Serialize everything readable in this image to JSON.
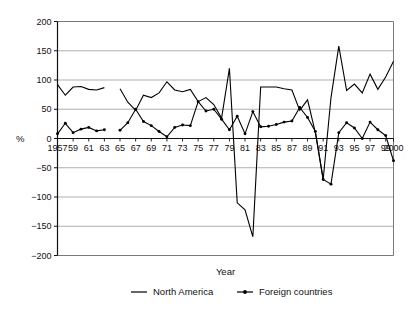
{
  "chart_data": {
    "type": "line",
    "title": "",
    "xlabel": "Year",
    "ylabel": "%",
    "ylim": [
      -200,
      200
    ],
    "xlim": [
      1957,
      2000
    ],
    "yticks": [
      200,
      150,
      100,
      50,
      0,
      -50,
      -100,
      -150,
      -200
    ],
    "ytick_labels": [
      "200",
      "150",
      "100",
      "50",
      "0",
      "−50",
      "−100",
      "−150",
      "−200"
    ],
    "xticks": [
      1957,
      1959,
      1961,
      1963,
      1965,
      1967,
      1969,
      1971,
      1973,
      1975,
      1977,
      1979,
      1981,
      1983,
      1985,
      1987,
      1989,
      1991,
      1993,
      1995,
      1997,
      1999,
      2000
    ],
    "xtick_labels": [
      "1957",
      "59",
      "61",
      "63",
      "65",
      "67",
      "69",
      "71",
      "73",
      "75",
      "77",
      "79",
      "81",
      "83",
      "85",
      "87",
      "89",
      "91",
      "93",
      "95",
      "97",
      "99",
      "2000"
    ],
    "grid": true,
    "grid_axis": "y",
    "legend_position": "bottom",
    "series": [
      {
        "name": "North America",
        "marker": "none",
        "color": "#000000",
        "x": [
          1957,
          1958,
          1959,
          1960,
          1961,
          1962,
          1963,
          1965,
          1966,
          1967,
          1968,
          1969,
          1970,
          1971,
          1972,
          1973,
          1974,
          1975,
          1976,
          1977,
          1978,
          1979,
          1980,
          1981,
          1982,
          1983,
          1984,
          1985,
          1986,
          1987,
          1988,
          1989,
          1990,
          1991,
          1992,
          1993,
          1994,
          1995,
          1996,
          1997,
          1998,
          1999,
          2000
        ],
        "y": [
          92,
          74,
          88,
          89,
          84,
          83,
          87,
          85,
          62,
          48,
          74,
          70,
          78,
          97,
          83,
          80,
          84,
          63,
          70,
          58,
          35,
          120,
          -110,
          -122,
          -168,
          88,
          88,
          88,
          85,
          83,
          48,
          66,
          10,
          -70,
          70,
          158,
          82,
          93,
          78,
          110,
          84,
          105,
          132
        ]
      },
      {
        "name": "Foreign countries",
        "marker": "dot",
        "color": "#000000",
        "x": [
          1957,
          1958,
          1959,
          1960,
          1961,
          1962,
          1963,
          1965,
          1966,
          1967,
          1968,
          1969,
          1970,
          1971,
          1972,
          1973,
          1974,
          1975,
          1976,
          1977,
          1978,
          1979,
          1980,
          1981,
          1982,
          1983,
          1984,
          1985,
          1986,
          1987,
          1988,
          1989,
          1990,
          1991,
          1992,
          1993,
          1994,
          1995,
          1996,
          1997,
          1998,
          1999,
          2000
        ],
        "y": [
          8,
          26,
          10,
          16,
          19,
          13,
          15,
          14,
          27,
          50,
          29,
          22,
          12,
          3,
          19,
          23,
          22,
          63,
          47,
          50,
          33,
          15,
          38,
          8,
          46,
          20,
          21,
          24,
          28,
          30,
          53,
          36,
          12,
          -70,
          -78,
          10,
          27,
          18,
          0,
          28,
          15,
          5,
          -38
        ]
      }
    ]
  },
  "legend": {
    "items": [
      {
        "label": "North America",
        "marker": "line"
      },
      {
        "label": "Foreign countries",
        "marker": "line-dot"
      }
    ]
  }
}
